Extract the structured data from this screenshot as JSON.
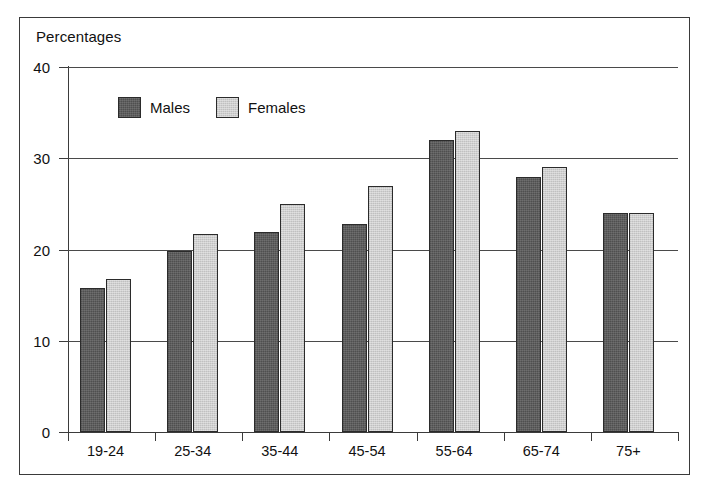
{
  "figure": {
    "title": "Percentages",
    "frame_color": "#3a3a3a",
    "background": "#ffffff"
  },
  "legend": {
    "entries": [
      {
        "label": "Males",
        "color": "#5e5e5e"
      },
      {
        "label": "Females",
        "color": "#cfcfcf"
      }
    ]
  },
  "axes": {
    "y_ticks": [
      "0",
      "10",
      "20",
      "30",
      "40"
    ],
    "x_ticks": [
      "19-24",
      "25-34",
      "35-44",
      "45-54",
      "55-64",
      "65-74",
      "75+"
    ]
  },
  "chart_data": {
    "type": "bar",
    "title": "Percentages",
    "xlabel": "",
    "ylabel": "Percentages",
    "ylim": [
      0,
      40
    ],
    "yticks": [
      0,
      10,
      20,
      30,
      40
    ],
    "grid": true,
    "legend_position": "inside-top-left",
    "categories": [
      "19-24",
      "25-34",
      "35-44",
      "45-54",
      "55-64",
      "65-74",
      "75+"
    ],
    "series": [
      {
        "name": "Males",
        "color": "#5e5e5e",
        "values": [
          15.8,
          19.8,
          21.9,
          22.8,
          32.0,
          28.0,
          24.0
        ]
      },
      {
        "name": "Females",
        "color": "#cfcfcf",
        "values": [
          16.8,
          21.7,
          25.0,
          27.0,
          33.0,
          29.0,
          24.0
        ]
      }
    ]
  }
}
